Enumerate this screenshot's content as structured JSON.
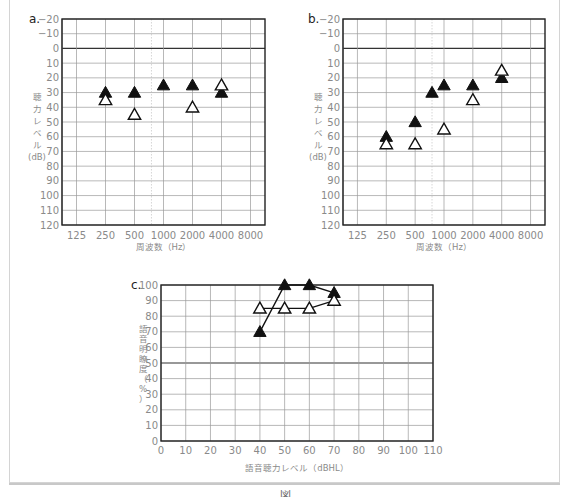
{
  "chart_data": [
    {
      "id": "a",
      "type": "scatter",
      "panel_label": "a.",
      "title": "",
      "xlabel": "周波数（Hz）",
      "ylabel": "聴力レベル (dB)",
      "x_categories": [
        "125",
        "250",
        "500",
        "1000",
        "2000",
        "4000",
        "8000"
      ],
      "y_ticks": [
        -20,
        -10,
        0,
        10,
        20,
        30,
        40,
        50,
        60,
        70,
        80,
        90,
        100,
        110,
        120
      ],
      "ylim": [
        -20,
        120
      ],
      "y_inverted": true,
      "grid": true,
      "series": [
        {
          "name": "filled-triangle",
          "marker": "filled-triangle",
          "points": [
            {
              "x": 250,
              "y": 30
            },
            {
              "x": 500,
              "y": 30
            },
            {
              "x": 1000,
              "y": 25
            },
            {
              "x": 2000,
              "y": 25
            },
            {
              "x": 4000,
              "y": 30
            }
          ]
        },
        {
          "name": "open-triangle",
          "marker": "open-triangle",
          "points": [
            {
              "x": 250,
              "y": 35
            },
            {
              "x": 500,
              "y": 45
            },
            {
              "x": 2000,
              "y": 40
            },
            {
              "x": 4000,
              "y": 25
            }
          ]
        }
      ]
    },
    {
      "id": "b",
      "type": "scatter",
      "panel_label": "b.",
      "title": "",
      "xlabel": "周波数（Hz）",
      "ylabel": "聴力レベル (dB)",
      "x_categories": [
        "125",
        "250",
        "500",
        "1000",
        "2000",
        "4000",
        "8000"
      ],
      "y_ticks": [
        -20,
        -10,
        0,
        10,
        20,
        30,
        40,
        50,
        60,
        70,
        80,
        90,
        100,
        110,
        120
      ],
      "ylim": [
        -20,
        120
      ],
      "y_inverted": true,
      "grid": true,
      "series": [
        {
          "name": "filled-triangle",
          "marker": "filled-triangle",
          "points": [
            {
              "x": 250,
              "y": 60
            },
            {
              "x": 500,
              "y": 50
            },
            {
              "x": 750,
              "y": 30
            },
            {
              "x": 1000,
              "y": 25
            },
            {
              "x": 2000,
              "y": 25
            },
            {
              "x": 4000,
              "y": 20
            }
          ]
        },
        {
          "name": "open-triangle",
          "marker": "open-triangle",
          "points": [
            {
              "x": 250,
              "y": 65
            },
            {
              "x": 500,
              "y": 65
            },
            {
              "x": 1000,
              "y": 55
            },
            {
              "x": 2000,
              "y": 35
            },
            {
              "x": 4000,
              "y": 15
            }
          ]
        }
      ]
    },
    {
      "id": "c",
      "type": "line",
      "panel_label": "c.",
      "title": "",
      "xlabel": "語音聴力レベル（dBHL）",
      "ylabel": "語音明瞭度（%）",
      "x_ticks": [
        0,
        10,
        20,
        30,
        40,
        50,
        60,
        70,
        80,
        90,
        100,
        110
      ],
      "y_ticks": [
        0,
        10,
        20,
        30,
        40,
        50,
        60,
        70,
        80,
        90,
        100
      ],
      "xlim": [
        0,
        110
      ],
      "ylim": [
        0,
        100
      ],
      "grid": true,
      "series": [
        {
          "name": "filled-triangle",
          "marker": "filled-triangle",
          "x": [
            40,
            50,
            60,
            70
          ],
          "y": [
            70,
            100,
            100,
            95
          ]
        },
        {
          "name": "open-triangle",
          "marker": "open-triangle",
          "x": [
            40,
            50,
            60,
            70
          ],
          "y": [
            85,
            85,
            85,
            90
          ]
        }
      ]
    }
  ],
  "labels": {
    "a": {
      "panel": "a.",
      "ylabel_lines": [
        "聴",
        "力",
        "レ",
        "ベ",
        "ル",
        "(dB)"
      ],
      "xlabel": "周波数（Hz）"
    },
    "b": {
      "panel": "b.",
      "ylabel_lines": [
        "聴",
        "力",
        "レ",
        "ベ",
        "ル",
        "(dB)"
      ],
      "xlabel": "周波数（Hz）"
    },
    "c": {
      "panel": "c.",
      "ylabel_lines": [
        "語",
        "音",
        "明",
        "瞭",
        "度",
        "（",
        "%",
        "）"
      ],
      "xlabel": "語音聴力レベル（dBHL）"
    }
  },
  "caption": "図"
}
